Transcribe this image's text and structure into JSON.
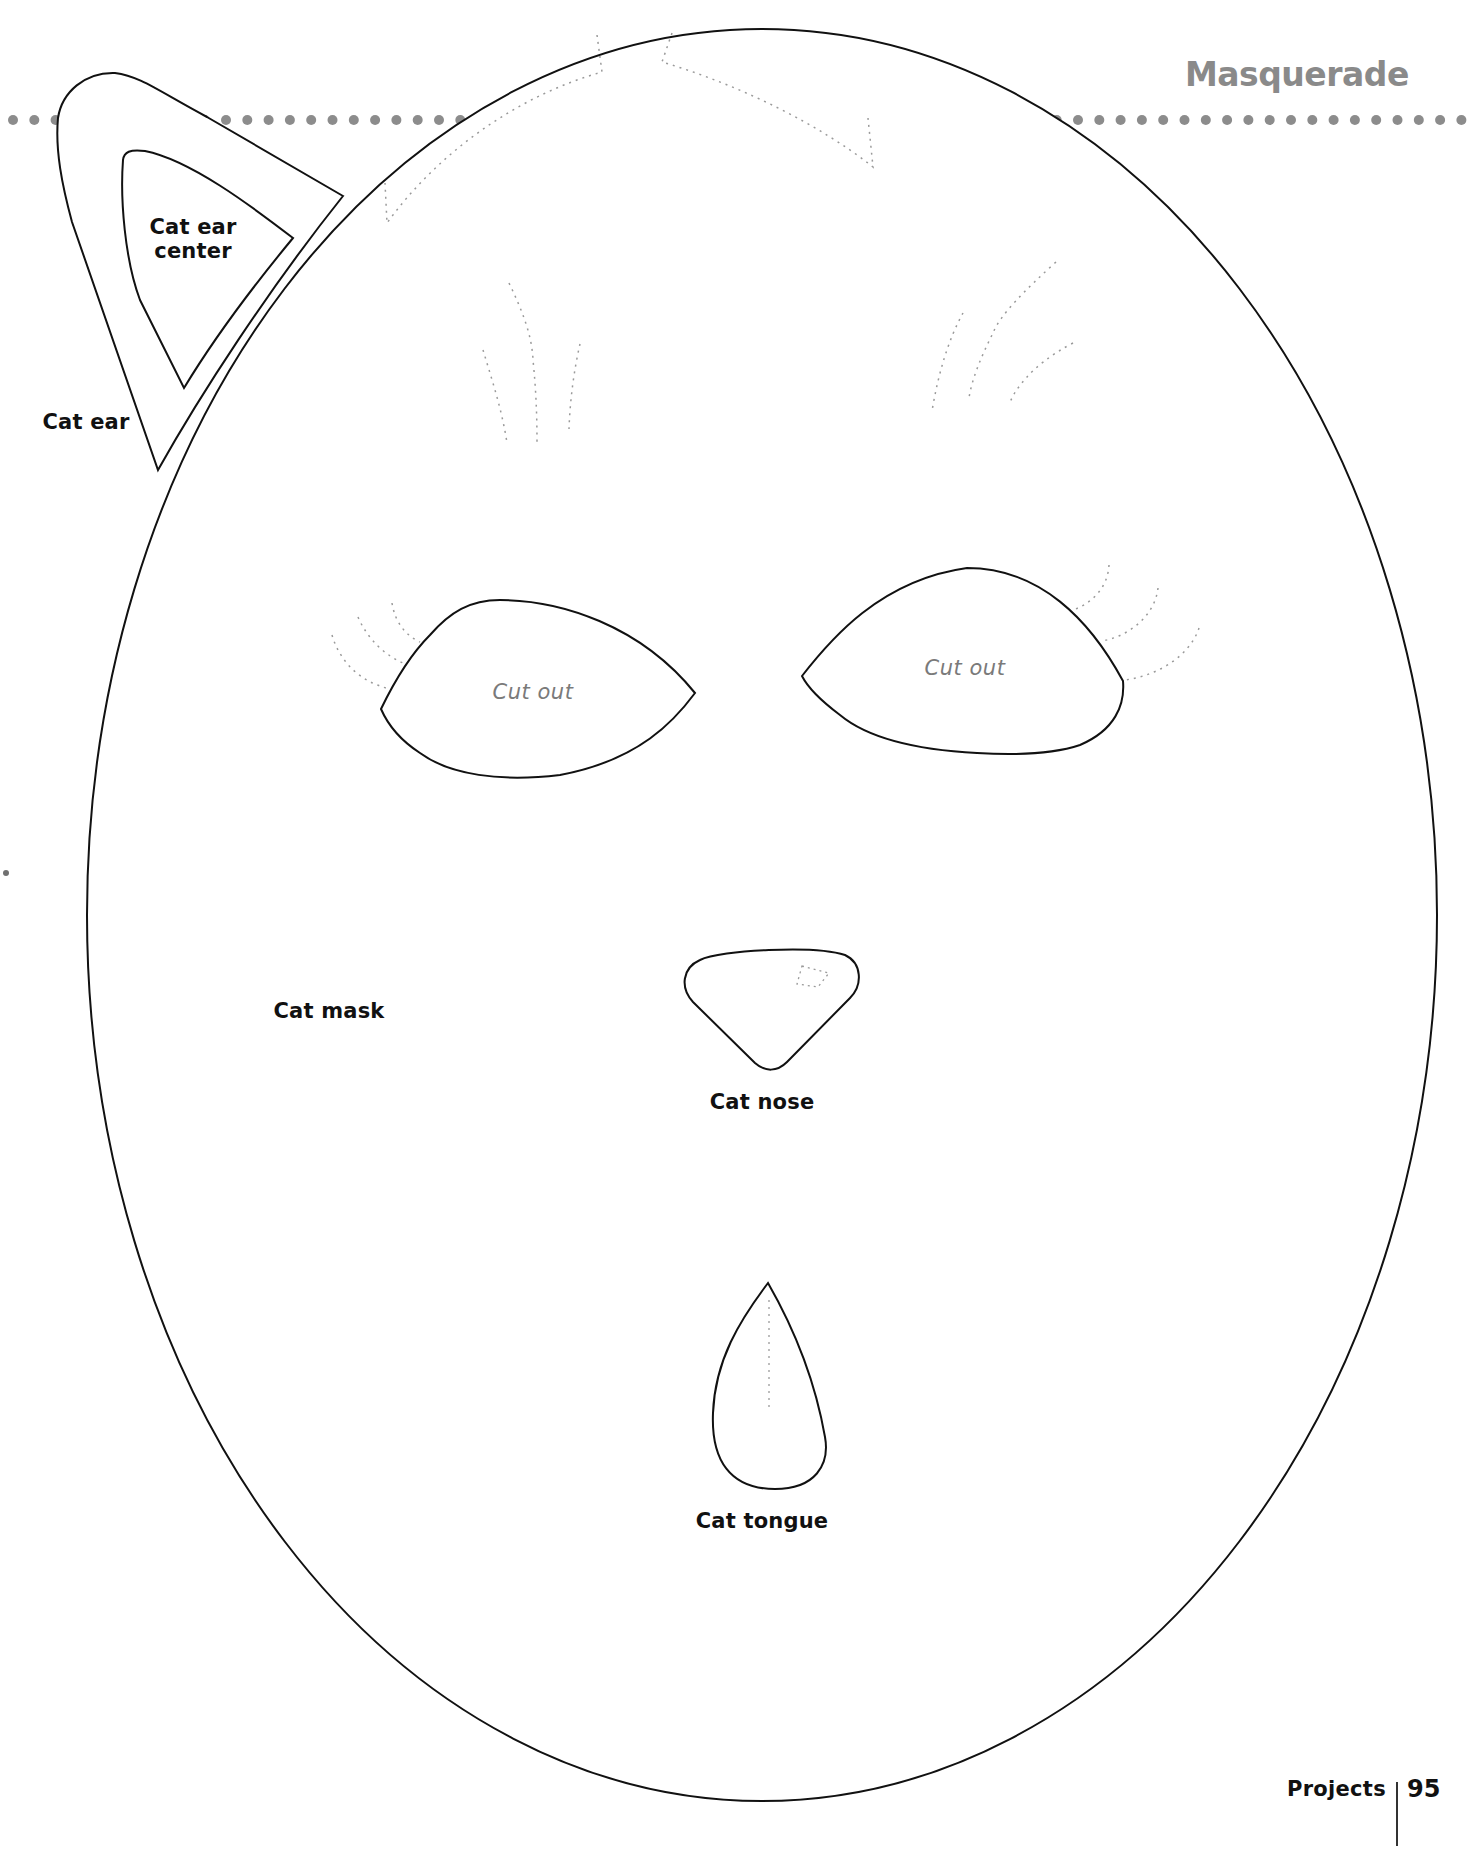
{
  "header": {
    "title": "Masquerade",
    "title_color": "#8a8a8a",
    "dot_rule_color": "#8c8c8c"
  },
  "templates": {
    "cat_ear": {
      "label": "Cat ear"
    },
    "cat_ear_center": {
      "label_line1": "Cat ear",
      "label_line2": "center"
    },
    "cat_mask": {
      "label": "Cat mask",
      "left_eye": {
        "label": "Cut out"
      },
      "right_eye": {
        "label": "Cut out"
      }
    },
    "cat_nose": {
      "label": "Cat nose"
    },
    "cat_tongue": {
      "label": "Cat tongue"
    }
  },
  "footer": {
    "section": "Projects",
    "page_number": "95"
  },
  "colors": {
    "outline": "#111111",
    "guide_dotted": "#9a9a9a",
    "cutout_text": "#7a7a7a"
  }
}
